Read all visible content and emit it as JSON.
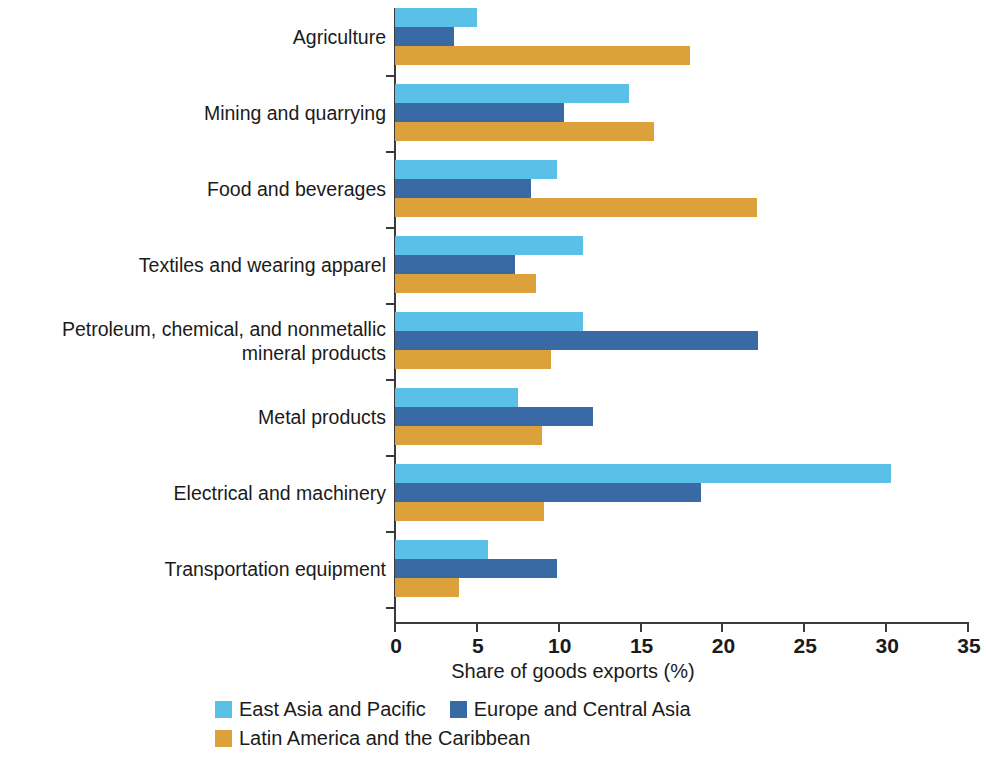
{
  "chart_data": {
    "type": "bar",
    "orientation": "horizontal",
    "title": "",
    "subtitle": "",
    "xlabel": "Share of goods exports (%)",
    "ylabel": "",
    "xlim": [
      0,
      35
    ],
    "xticks": [
      0,
      5,
      10,
      15,
      20,
      25,
      30,
      35
    ],
    "xtick_labels": [
      "0",
      "5",
      "10",
      "15",
      "20",
      "25",
      "30",
      "35"
    ],
    "grid": false,
    "legend_position": "bottom",
    "categories": [
      "Agriculture",
      "Mining and quarrying",
      "Food and beverages",
      "Textiles and wearing apparel",
      "Petroleum, chemical, and nonmetallic\nmineral products",
      "Metal products",
      "Electrical and machinery",
      "Transportation equipment"
    ],
    "series": [
      {
        "name": "East Asia and Pacific",
        "color": "#5BC0E8",
        "values": [
          5.0,
          14.3,
          9.9,
          11.5,
          11.5,
          7.5,
          30.3,
          5.7
        ]
      },
      {
        "name": "Europe and Central Asia",
        "color": "#3A6AA5",
        "values": [
          3.6,
          10.3,
          8.3,
          7.3,
          22.2,
          12.1,
          18.7,
          9.9
        ]
      },
      {
        "name": "Latin America and the Caribbean",
        "color": "#DDA13B",
        "values": [
          18.0,
          15.8,
          22.1,
          8.6,
          9.5,
          9.0,
          9.1,
          3.9
        ]
      }
    ]
  },
  "axis": {
    "line_color": "#3a3a3a"
  }
}
